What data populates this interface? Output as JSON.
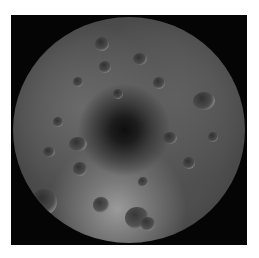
{
  "image": {
    "subject": "Lunar south pole mosaic",
    "description": "Grayscale circular view of a cratered moon surface centered on a dark polar region, on a black square background",
    "colors": {
      "background": "#ffffff",
      "frame": "#050505",
      "surface_mid": "#5a5a5a",
      "pole_shadow": "#0e0e0e",
      "highlight": "#9a9a9a"
    }
  }
}
